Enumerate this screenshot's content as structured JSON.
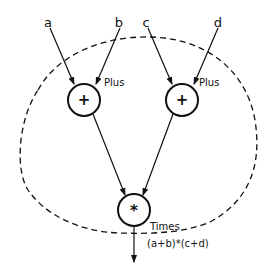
{
  "inputs": [
    {
      "name": "a"
    },
    {
      "name": "b"
    },
    {
      "name": "c"
    },
    {
      "name": "d"
    }
  ],
  "nodes": [
    {
      "id": "plus-left",
      "symbol": "+",
      "label": "Plus"
    },
    {
      "id": "plus-right",
      "symbol": "+",
      "label": "Plus"
    },
    {
      "id": "times",
      "symbol": "*",
      "label": "Times"
    }
  ],
  "output": {
    "label": "(a+b)*(c+d)"
  },
  "colors": {
    "stroke": "#111111",
    "background": "#ffffff"
  }
}
